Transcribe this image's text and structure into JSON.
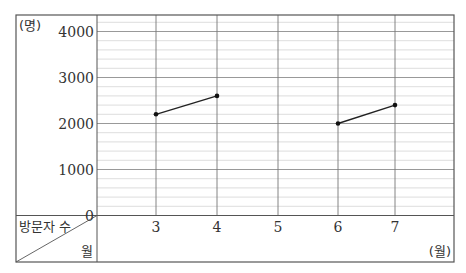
{
  "chart_data": {
    "type": "line",
    "title": "",
    "xlabel": "월",
    "ylabel": "방문자 수",
    "x_unit": "(월)",
    "y_unit": "(명)",
    "corner_labels": {
      "top": "방문자 수",
      "bottom": "월"
    },
    "categories": [
      "3",
      "4",
      "5",
      "6",
      "7"
    ],
    "segments": [
      {
        "x": [
          "3",
          "4"
        ],
        "values": [
          2200,
          2600
        ]
      },
      {
        "x": [
          "6",
          "7"
        ],
        "values": [
          2000,
          2400
        ]
      }
    ],
    "y_ticks": [
      0,
      1000,
      2000,
      3000,
      4000
    ],
    "ylim": [
      0,
      4400
    ],
    "minor_grid_step": 200,
    "grid": true,
    "legend": "none"
  }
}
